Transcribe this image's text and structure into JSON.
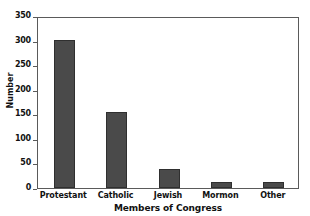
{
  "chart_data": {
    "type": "bar",
    "title": "",
    "subtitle": "",
    "categories": [
      "Protestant",
      "Catholic",
      "Jewish",
      "Mormon",
      "Other"
    ],
    "values": [
      302,
      154,
      38,
      13,
      13
    ],
    "xlabel": "Members of Congress",
    "ylabel": "Number",
    "ylim": [
      0,
      350
    ],
    "yticks": [
      0,
      50,
      100,
      150,
      200,
      250,
      300,
      350
    ],
    "ytick_labels": [
      "0",
      "50",
      "100",
      "150",
      "200",
      "250",
      "300",
      "350"
    ],
    "grid": false,
    "legend": null,
    "annotations": [],
    "colors": {
      "bar_fill": "#4a4a4a",
      "bar_border": "#2f2f2f",
      "frame": "#5a5a5a",
      "background": "#ffffff",
      "text": "#111111"
    }
  }
}
